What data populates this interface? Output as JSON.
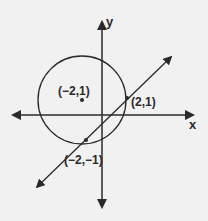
{
  "diagram": {
    "type": "coordinate-geometry",
    "axes": {
      "x_label": "x",
      "y_label": "y"
    },
    "circle": {
      "center_label": "(−2,1)"
    },
    "points": [
      {
        "id": "center",
        "label": "(−2,1)"
      },
      {
        "id": "upper-intersection",
        "label": "(2,1)"
      },
      {
        "id": "lower-intersection",
        "label": "(−2,−1)"
      }
    ],
    "colors": {
      "background": "#f1f1f1",
      "ink": "#2a2a2a"
    }
  }
}
